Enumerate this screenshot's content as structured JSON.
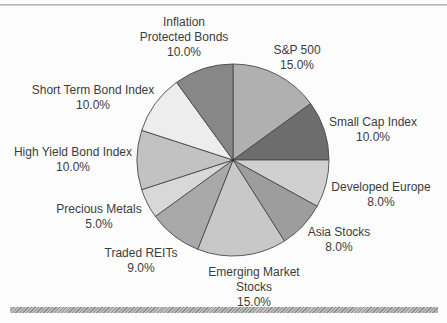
{
  "figure": {
    "background_color": "#fcfcfc",
    "top_rule_color": "#b2b2b2",
    "bottom_rule_color": "#9a9a9a",
    "text_color": "#3c3c3c",
    "slice_outline_color": "#4a4a4a"
  },
  "chart_data": {
    "type": "pie",
    "title": "",
    "unit": "%",
    "start_angle_deg": 0,
    "direction": "clockwise",
    "total": 100.0,
    "slices": [
      {
        "name": "S&P 500",
        "value": 15.0,
        "pct_label": "15.0%",
        "color": "#b0b0b0",
        "label_lines": [
          "S&P 500",
          "15.0%"
        ]
      },
      {
        "name": "Small Cap Index",
        "value": 10.0,
        "pct_label": "10.0%",
        "color": "#6d6d6d",
        "label_lines": [
          "Small Cap Index",
          "10.0%"
        ]
      },
      {
        "name": "Developed Europe",
        "value": 8.0,
        "pct_label": "8.0%",
        "color": "#d0d0d0",
        "label_lines": [
          "Developed Europe",
          "8.0%"
        ]
      },
      {
        "name": "Asia Stocks",
        "value": 8.0,
        "pct_label": "8.0%",
        "color": "#9d9d9d",
        "label_lines": [
          "Asia Stocks",
          "8.0%"
        ]
      },
      {
        "name": "Emerging Market Stocks",
        "value": 15.0,
        "pct_label": "15.0%",
        "color": "#c8c8c8",
        "label_lines": [
          "Emerging Market",
          "Stocks",
          "15.0%"
        ]
      },
      {
        "name": "Traded REITs",
        "value": 9.0,
        "pct_label": "9.0%",
        "color": "#a9a9a9",
        "label_lines": [
          "Traded REITs",
          "9.0%"
        ]
      },
      {
        "name": "Precious Metals",
        "value": 5.0,
        "pct_label": "5.0%",
        "color": "#d8d8d8",
        "label_lines": [
          "Precious Metals",
          "5.0%"
        ]
      },
      {
        "name": "High Yield Bond Index",
        "value": 10.0,
        "pct_label": "10.0%",
        "color": "#c2c2c2",
        "label_lines": [
          "High Yield Bond Index",
          "10.0%"
        ]
      },
      {
        "name": "Short Term Bond Index",
        "value": 10.0,
        "pct_label": "10.0%",
        "color": "#ededed",
        "label_lines": [
          "Short Term Bond Index",
          "10.0%"
        ]
      },
      {
        "name": "Inflation Protected Bonds",
        "value": 10.0,
        "pct_label": "10.0%",
        "color": "#878787",
        "label_lines": [
          "Inflation",
          "Protected Bonds",
          "10.0%"
        ]
      }
    ]
  }
}
